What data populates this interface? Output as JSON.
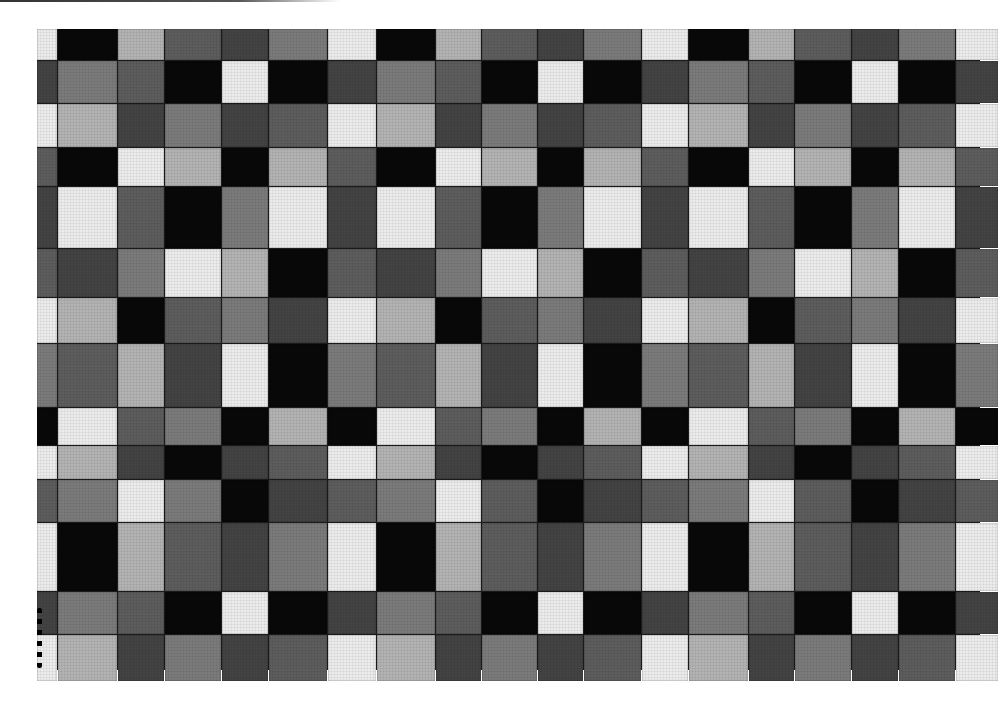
{
  "artwork": {
    "description": "Grayscale photograph of a hand-painted checkered grid of squares",
    "shades": {
      "W": "#ececec",
      "L": "#b3b3b3",
      "M": "#7b7b7b",
      "D": "#5d5d5d",
      "K": "#434343",
      "B": "#080808"
    },
    "columns": 19,
    "rows": 14,
    "grid": [
      [
        "W",
        "B",
        "L",
        "D",
        "K",
        "M",
        "W",
        "B",
        "L",
        "D",
        "K",
        "M",
        "W",
        "B",
        "L",
        "D",
        "K",
        "M",
        "W"
      ],
      [
        "K",
        "M",
        "D",
        "B",
        "W",
        "B",
        "K",
        "M",
        "D",
        "B",
        "W",
        "B",
        "K",
        "M",
        "D",
        "B",
        "W",
        "B",
        "K"
      ],
      [
        "W",
        "L",
        "K",
        "M",
        "K",
        "D",
        "W",
        "L",
        "K",
        "M",
        "K",
        "D",
        "W",
        "L",
        "K",
        "M",
        "K",
        "D",
        "W"
      ],
      [
        "D",
        "B",
        "W",
        "L",
        "B",
        "L",
        "D",
        "B",
        "W",
        "L",
        "B",
        "L",
        "D",
        "B",
        "W",
        "L",
        "B",
        "L",
        "D"
      ],
      [
        "K",
        "W",
        "D",
        "B",
        "M",
        "W",
        "K",
        "W",
        "D",
        "B",
        "M",
        "W",
        "K",
        "W",
        "D",
        "B",
        "M",
        "W",
        "K"
      ],
      [
        "D",
        "K",
        "M",
        "W",
        "L",
        "B",
        "D",
        "K",
        "M",
        "W",
        "L",
        "B",
        "D",
        "K",
        "M",
        "W",
        "L",
        "B",
        "D"
      ],
      [
        "W",
        "L",
        "B",
        "D",
        "M",
        "K",
        "W",
        "L",
        "B",
        "D",
        "M",
        "K",
        "W",
        "L",
        "B",
        "D",
        "M",
        "K",
        "W"
      ],
      [
        "M",
        "D",
        "L",
        "K",
        "W",
        "B",
        "M",
        "D",
        "L",
        "K",
        "W",
        "B",
        "M",
        "D",
        "L",
        "K",
        "W",
        "B",
        "M"
      ],
      [
        "B",
        "W",
        "D",
        "M",
        "B",
        "L",
        "B",
        "W",
        "D",
        "M",
        "B",
        "L",
        "B",
        "W",
        "D",
        "M",
        "B",
        "L",
        "B"
      ],
      [
        "W",
        "L",
        "K",
        "B",
        "K",
        "D",
        "W",
        "L",
        "K",
        "B",
        "K",
        "D",
        "W",
        "L",
        "K",
        "B",
        "K",
        "D",
        "W"
      ],
      [
        "D",
        "M",
        "W",
        "M",
        "B",
        "K",
        "D",
        "M",
        "W",
        "D",
        "B",
        "K",
        "D",
        "M",
        "W",
        "D",
        "B",
        "K",
        "D"
      ],
      [
        "W",
        "B",
        "L",
        "D",
        "K",
        "M",
        "W",
        "B",
        "L",
        "D",
        "K",
        "M",
        "W",
        "B",
        "L",
        "D",
        "K",
        "M",
        "W"
      ],
      [
        "K",
        "M",
        "D",
        "B",
        "W",
        "B",
        "K",
        "M",
        "D",
        "B",
        "W",
        "B",
        "K",
        "M",
        "D",
        "B",
        "W",
        "B",
        "K"
      ],
      [
        "W",
        "L",
        "K",
        "M",
        "K",
        "D",
        "W",
        "L",
        "K",
        "M",
        "K",
        "D",
        "W",
        "L",
        "K",
        "M",
        "K",
        "D",
        "W"
      ]
    ]
  }
}
